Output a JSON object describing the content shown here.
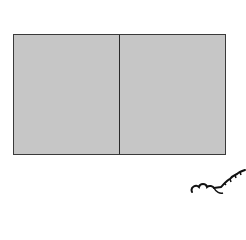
{
  "diagram": {
    "shape": "rectangle-divided-in-two",
    "parts": [
      {
        "id": "left",
        "fill": "#c6c6c6"
      },
      {
        "id": "right",
        "fill": "#c6c6c6"
      }
    ],
    "border_color": "#2a2a2a",
    "decoration": "cloud-squiggle-bottom-right"
  }
}
